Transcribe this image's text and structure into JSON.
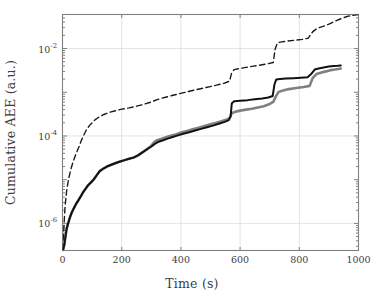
{
  "figure": {
    "background": "#ffffff",
    "axis_color": "#808080",
    "grid_color": "#d9d9d9",
    "text_color": "#3d3d3d"
  },
  "axes": {
    "xlabel": "Time (s)",
    "ylabel": "Cumulative AEE (a.u.)",
    "xticks": [
      {
        "value": 0,
        "label": "0"
      },
      {
        "value": 200,
        "label": "200"
      },
      {
        "value": 400,
        "label": "400"
      },
      {
        "value": 600,
        "label": "600"
      },
      {
        "value": 800,
        "label": "800"
      },
      {
        "value": 1000,
        "label": "1000"
      }
    ],
    "yticks": [
      {
        "value": 0.01,
        "mantissa": "10",
        "exponent": "-2"
      },
      {
        "value": 0.0001,
        "mantissa": "10",
        "exponent": "-4"
      },
      {
        "value": 1e-06,
        "mantissa": "10",
        "exponent": "-6"
      }
    ]
  },
  "chart_data": {
    "type": "line",
    "title": "",
    "xlabel": "Time (s)",
    "ylabel": "Cumulative AEE (a.u.)",
    "xlim": [
      0,
      1000
    ],
    "ylim": [
      2.4e-07,
      0.06
    ],
    "yscale": "log",
    "xscale": "linear",
    "grid": true,
    "legend": "none",
    "xticks": [
      0,
      200,
      400,
      600,
      800,
      1000
    ],
    "yticks": [
      1e-06,
      0.0001,
      0.01
    ],
    "series": [
      {
        "name": "dashed-curve",
        "style": "dashed",
        "color": "#1a1a1a",
        "width": 1.4,
        "points": [
          [
            2,
            2.6e-07
          ],
          [
            5,
            9e-07
          ],
          [
            9,
            2.6e-06
          ],
          [
            14,
            5.5e-06
          ],
          [
            20,
            1e-05
          ],
          [
            28,
            1.7e-05
          ],
          [
            36,
            2.6e-05
          ],
          [
            45,
            3.8e-05
          ],
          [
            55,
            5.5e-05
          ],
          [
            64,
            8e-05
          ],
          [
            72,
            0.000105
          ],
          [
            80,
            0.000135
          ],
          [
            90,
            0.00017
          ],
          [
            100,
            0.0002
          ],
          [
            112,
            0.00024
          ],
          [
            125,
            0.000275
          ],
          [
            140,
            0.00031
          ],
          [
            160,
            0.00035
          ],
          [
            180,
            0.00038
          ],
          [
            200,
            0.00041
          ],
          [
            225,
            0.00044
          ],
          [
            250,
            0.00048
          ],
          [
            275,
            0.00053
          ],
          [
            300,
            0.0006
          ],
          [
            320,
            0.00068
          ],
          [
            345,
            0.00076
          ],
          [
            370,
            0.00084
          ],
          [
            395,
            0.00093
          ],
          [
            420,
            0.00102
          ],
          [
            445,
            0.00112
          ],
          [
            470,
            0.00122
          ],
          [
            495,
            0.00133
          ],
          [
            520,
            0.00145
          ],
          [
            545,
            0.0016
          ],
          [
            565,
            0.0018
          ],
          [
            570,
            0.0026
          ],
          [
            580,
            0.0033
          ],
          [
            600,
            0.0035
          ],
          [
            620,
            0.0037
          ],
          [
            645,
            0.00395
          ],
          [
            670,
            0.0042
          ],
          [
            695,
            0.0045
          ],
          [
            712,
            0.0048
          ],
          [
            718,
            0.0095
          ],
          [
            726,
            0.0135
          ],
          [
            740,
            0.0142
          ],
          [
            760,
            0.0148
          ],
          [
            785,
            0.0155
          ],
          [
            810,
            0.0162
          ],
          [
            830,
            0.0172
          ],
          [
            845,
            0.024
          ],
          [
            860,
            0.029
          ],
          [
            880,
            0.032
          ],
          [
            900,
            0.036
          ],
          [
            920,
            0.042
          ],
          [
            940,
            0.048
          ],
          [
            965,
            0.055
          ],
          [
            1000,
            0.06
          ]
        ]
      },
      {
        "name": "gray-solid-curve",
        "style": "solid",
        "color": "#808080",
        "width": 2.6,
        "points": [
          [
            2,
            2.5e-07
          ],
          [
            6,
            3.2e-07
          ],
          [
            10,
            5e-07
          ],
          [
            14,
            7.5e-07
          ],
          [
            18,
            9.5e-07
          ],
          [
            24,
            1.3e-06
          ],
          [
            30,
            1.7e-06
          ],
          [
            38,
            2.2e-06
          ],
          [
            46,
            2.8e-06
          ],
          [
            55,
            3.5e-06
          ],
          [
            62,
            4.2e-06
          ],
          [
            70,
            5.2e-06
          ],
          [
            78,
            6.2e-06
          ],
          [
            86,
            7.4e-06
          ],
          [
            95,
            8.5e-06
          ],
          [
            105,
            1e-05
          ],
          [
            115,
            1.25e-05
          ],
          [
            125,
            1.55e-05
          ],
          [
            138,
            1.8e-05
          ],
          [
            150,
            2e-05
          ],
          [
            165,
            2.2e-05
          ],
          [
            180,
            2.4e-05
          ],
          [
            195,
            2.6e-05
          ],
          [
            210,
            2.8e-05
          ],
          [
            225,
            3e-05
          ],
          [
            240,
            3.2e-05
          ],
          [
            255,
            3.6e-05
          ],
          [
            270,
            4.2e-05
          ],
          [
            285,
            5e-05
          ],
          [
            298,
            5.8e-05
          ],
          [
            310,
            7.2e-05
          ],
          [
            320,
            8e-05
          ],
          [
            335,
            8.6e-05
          ],
          [
            350,
            9.3e-05
          ],
          [
            368,
            0.000102
          ],
          [
            385,
            0.00011
          ],
          [
            400,
            0.00012
          ],
          [
            420,
            0.00013
          ],
          [
            440,
            0.000142
          ],
          [
            460,
            0.000155
          ],
          [
            480,
            0.00017
          ],
          [
            500,
            0.000185
          ],
          [
            520,
            0.0002
          ],
          [
            540,
            0.00022
          ],
          [
            558,
            0.00024
          ],
          [
            566,
            0.00027
          ],
          [
            572,
            0.00033
          ],
          [
            585,
            0.00036
          ],
          [
            600,
            0.00038
          ],
          [
            620,
            0.0004
          ],
          [
            640,
            0.00042
          ],
          [
            660,
            0.00045
          ],
          [
            680,
            0.00048
          ],
          [
            700,
            0.00054
          ],
          [
            712,
            0.0006
          ],
          [
            720,
            0.00078
          ],
          [
            730,
            0.00102
          ],
          [
            745,
            0.0011
          ],
          [
            765,
            0.00118
          ],
          [
            790,
            0.00125
          ],
          [
            815,
            0.00132
          ],
          [
            835,
            0.0014
          ],
          [
            845,
            0.0021
          ],
          [
            858,
            0.0026
          ],
          [
            872,
            0.0028
          ],
          [
            890,
            0.003
          ],
          [
            905,
            0.0032
          ],
          [
            920,
            0.0033
          ],
          [
            932,
            0.0034
          ],
          [
            940,
            0.0035
          ]
        ]
      },
      {
        "name": "black-solid-curve",
        "style": "solid",
        "color": "#111111",
        "width": 2.0,
        "points": [
          [
            2,
            2.5e-07
          ],
          [
            6,
            3.2e-07
          ],
          [
            10,
            5e-07
          ],
          [
            14,
            7.5e-07
          ],
          [
            18,
            9.5e-07
          ],
          [
            24,
            1.3e-06
          ],
          [
            30,
            1.7e-06
          ],
          [
            38,
            2.2e-06
          ],
          [
            46,
            2.8e-06
          ],
          [
            55,
            3.5e-06
          ],
          [
            62,
            4.2e-06
          ],
          [
            70,
            5.2e-06
          ],
          [
            78,
            6.2e-06
          ],
          [
            86,
            7.4e-06
          ],
          [
            95,
            8.5e-06
          ],
          [
            105,
            1e-05
          ],
          [
            115,
            1.25e-05
          ],
          [
            125,
            1.55e-05
          ],
          [
            138,
            1.8e-05
          ],
          [
            150,
            2e-05
          ],
          [
            165,
            2.2e-05
          ],
          [
            180,
            2.4e-05
          ],
          [
            195,
            2.6e-05
          ],
          [
            210,
            2.8e-05
          ],
          [
            225,
            3e-05
          ],
          [
            240,
            3.2e-05
          ],
          [
            255,
            3.6e-05
          ],
          [
            270,
            4.2e-05
          ],
          [
            285,
            4.9e-05
          ],
          [
            298,
            5.6e-05
          ],
          [
            312,
            6.6e-05
          ],
          [
            325,
            7.4e-05
          ],
          [
            340,
            8e-05
          ],
          [
            355,
            8.7e-05
          ],
          [
            372,
            9.5e-05
          ],
          [
            390,
            0.000103
          ],
          [
            408,
            0.000112
          ],
          [
            428,
            0.000122
          ],
          [
            448,
            0.000133
          ],
          [
            468,
            0.000145
          ],
          [
            488,
            0.000158
          ],
          [
            508,
            0.000172
          ],
          [
            528,
            0.00019
          ],
          [
            548,
            0.00021
          ],
          [
            562,
            0.00023
          ],
          [
            568,
            0.00028
          ],
          [
            572,
            0.00056
          ],
          [
            580,
            0.00062
          ],
          [
            600,
            0.00064
          ],
          [
            625,
            0.00066
          ],
          [
            650,
            0.00069
          ],
          [
            675,
            0.00072
          ],
          [
            695,
            0.00076
          ],
          [
            710,
            0.00082
          ],
          [
            716,
            0.0015
          ],
          [
            722,
            0.00195
          ],
          [
            735,
            0.002
          ],
          [
            755,
            0.00205
          ],
          [
            780,
            0.0021
          ],
          [
            805,
            0.00215
          ],
          [
            828,
            0.0022
          ],
          [
            840,
            0.0026
          ],
          [
            852,
            0.0033
          ],
          [
            865,
            0.0035
          ],
          [
            882,
            0.0037
          ],
          [
            900,
            0.0039
          ],
          [
            915,
            0.004
          ],
          [
            930,
            0.00405
          ],
          [
            940,
            0.0041
          ]
        ]
      }
    ]
  }
}
